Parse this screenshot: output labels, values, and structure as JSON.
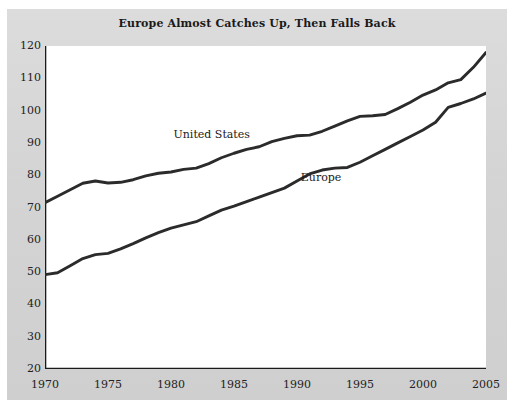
{
  "chart_data": {
    "type": "line",
    "title": "Europe Almost Catches Up, Then Falls Back",
    "xlabel": "",
    "ylabel": "",
    "xlim": [
      1970,
      2005
    ],
    "ylim": [
      20,
      120
    ],
    "grid": false,
    "legend_position": "inline",
    "x_tick_labels": [
      "1970",
      "1975",
      "1980",
      "1985",
      "1990",
      "1995",
      "2000",
      "2005"
    ],
    "x_tick_values": [
      1970,
      1975,
      1980,
      1985,
      1990,
      1995,
      2000,
      2005
    ],
    "x_minor_tick_step": 1,
    "y_tick_labels": [
      "20",
      "30",
      "40",
      "50",
      "60",
      "70",
      "80",
      "90",
      "100",
      "110",
      "120"
    ],
    "y_tick_values": [
      20,
      30,
      40,
      50,
      60,
      70,
      80,
      90,
      100,
      110,
      120
    ],
    "x": [
      1970,
      1971,
      1972,
      1973,
      1974,
      1975,
      1976,
      1977,
      1978,
      1979,
      1980,
      1981,
      1982,
      1983,
      1984,
      1985,
      1986,
      1987,
      1988,
      1989,
      1990,
      1991,
      1992,
      1993,
      1994,
      1995,
      1996,
      1997,
      1998,
      1999,
      2000,
      2001,
      2002,
      2003,
      2004,
      2005
    ],
    "series": [
      {
        "name": "United States",
        "color": "#2b2b2b",
        "label_x": 1980.2,
        "label_y": 92.5,
        "values": [
          71.5,
          73.5,
          75.5,
          77.5,
          78.2,
          77.6,
          77.8,
          78.6,
          79.8,
          80.6,
          81.0,
          81.8,
          82.2,
          83.6,
          85.4,
          86.8,
          88.0,
          88.8,
          90.4,
          91.4,
          92.2,
          92.4,
          93.6,
          95.2,
          96.8,
          98.2,
          98.4,
          98.8,
          100.6,
          102.6,
          104.8,
          106.4,
          108.6,
          109.6,
          113.4,
          118.0
        ]
      },
      {
        "name": "Europe",
        "color": "#2b2b2b",
        "label_x": 1990.3,
        "label_y": 79.0,
        "values": [
          49.2,
          49.8,
          52.0,
          54.2,
          55.4,
          55.8,
          57.2,
          58.8,
          60.6,
          62.2,
          63.6,
          64.6,
          65.6,
          67.4,
          69.2,
          70.4,
          71.8,
          73.2,
          74.6,
          76.0,
          78.2,
          80.4,
          81.6,
          82.2,
          82.4,
          84.0,
          86.0,
          88.0,
          90.0,
          92.0,
          94.0,
          96.4,
          101.0,
          102.2,
          103.6,
          105.4
        ]
      }
    ]
  }
}
